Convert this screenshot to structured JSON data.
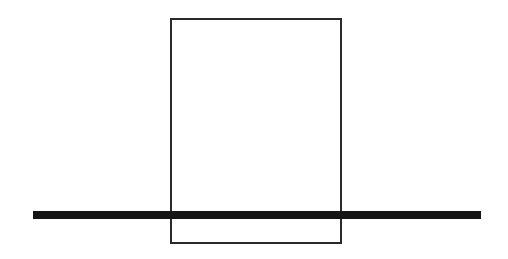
{
  "diagram": {
    "colors": {
      "background": "#ffffff",
      "rectangle_stroke": "#2a2a2a",
      "bar_fill": "#161616"
    },
    "elements": [
      {
        "name": "rectangle",
        "style": "outline"
      },
      {
        "name": "horizontal-bar",
        "style": "filled"
      }
    ]
  }
}
